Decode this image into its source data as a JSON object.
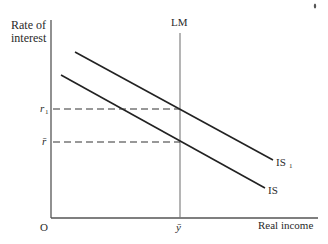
{
  "diagram": {
    "type": "IS-LM",
    "y_axis_label_line1": "Rate of",
    "y_axis_label_line2": "interest",
    "x_axis_label": "Real income",
    "origin_label": "O",
    "lm_label": "LM",
    "is_label": "IS",
    "is1_label": "IS",
    "is1_subscript": "1",
    "r1_label": "r",
    "r1_subscript": "1",
    "rbar_label": "r̄",
    "ybar_label": "ȳ",
    "colors": {
      "ink": "#2a2a2a",
      "axis": "#555555",
      "background": "#ffffff"
    }
  }
}
